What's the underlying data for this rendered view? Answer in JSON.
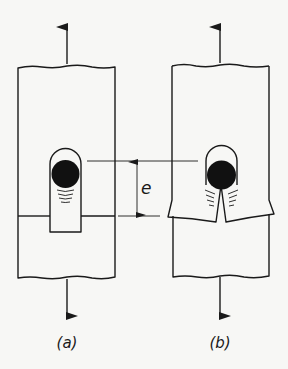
{
  "figure": {
    "panels": [
      {
        "id": "a",
        "label": "(a)",
        "description": "specimen with slot, crack tip below pin, straight shoulder"
      },
      {
        "id": "b",
        "label": "(b)",
        "description": "specimen with pin, split V-shaped flaps"
      }
    ],
    "dimension": {
      "symbol": "e"
    },
    "colors": {
      "ink": "#1a1a1a",
      "background": "#f7f7f5"
    }
  }
}
